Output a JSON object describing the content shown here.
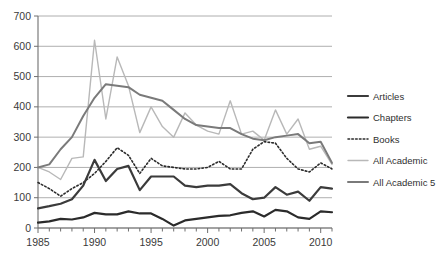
{
  "chart_data": {
    "type": "line",
    "title": "",
    "xlabel": "",
    "ylabel": "",
    "xlim": [
      1985,
      2011
    ],
    "ylim": [
      0,
      700
    ],
    "ytick_labels": [
      "0",
      "100",
      "200",
      "300",
      "400",
      "500",
      "600",
      "700"
    ],
    "yticks": [
      0,
      100,
      200,
      300,
      400,
      500,
      600,
      700
    ],
    "xtick_labels": [
      "1985",
      "1990",
      "1995",
      "2000",
      "2005",
      "2010"
    ],
    "xticks": [
      1985,
      1990,
      1995,
      2000,
      2005,
      2010
    ],
    "grid": "horizontal",
    "legend_position": "right",
    "x": [
      1985,
      1986,
      1987,
      1988,
      1989,
      1990,
      1991,
      1992,
      1993,
      1994,
      1995,
      1996,
      1997,
      1998,
      1999,
      2000,
      2001,
      2002,
      2003,
      2004,
      2005,
      2006,
      2007,
      2008,
      2009,
      2010,
      2011
    ],
    "series": [
      {
        "name": "Articles",
        "color": "#3b3b3b",
        "style": "solid",
        "width": 2.2,
        "values": [
          65,
          72,
          80,
          95,
          140,
          225,
          155,
          195,
          205,
          125,
          170,
          170,
          170,
          140,
          135,
          140,
          140,
          145,
          115,
          95,
          100,
          135,
          110,
          120,
          90,
          135,
          130
        ]
      },
      {
        "name": "Chapters",
        "color": "#2b2b2b",
        "style": "solid",
        "width": 2.2,
        "values": [
          18,
          22,
          30,
          28,
          35,
          50,
          45,
          45,
          55,
          48,
          48,
          30,
          8,
          25,
          30,
          35,
          40,
          42,
          50,
          55,
          38,
          60,
          55,
          35,
          30,
          55,
          52
        ]
      },
      {
        "name": "Books",
        "color": "#2b2b2b",
        "style": "dotted",
        "width": 1.6,
        "values": [
          150,
          130,
          105,
          130,
          150,
          180,
          220,
          265,
          240,
          180,
          230,
          205,
          200,
          195,
          195,
          200,
          220,
          195,
          195,
          260,
          285,
          280,
          230,
          195,
          185,
          215,
          195
        ]
      },
      {
        "name": "All Academic",
        "color": "#b8b8b8",
        "style": "solid",
        "width": 1.4,
        "values": [
          200,
          185,
          160,
          230,
          235,
          620,
          360,
          565,
          470,
          315,
          400,
          335,
          300,
          380,
          340,
          320,
          310,
          420,
          310,
          320,
          290,
          390,
          310,
          360,
          260,
          270,
          210
        ]
      },
      {
        "name": "All Academic 5",
        "color": "#7a7a7a",
        "style": "solid",
        "width": 2.0,
        "values": [
          200,
          210,
          260,
          300,
          370,
          430,
          475,
          470,
          465,
          440,
          430,
          420,
          390,
          360,
          340,
          335,
          330,
          330,
          310,
          295,
          290,
          300,
          305,
          310,
          280,
          285,
          215
        ]
      }
    ]
  },
  "axes": {
    "y_labels": [
      "700",
      "600",
      "500",
      "400",
      "300",
      "200",
      "100",
      "0"
    ],
    "x_labels": [
      "1985",
      "1990",
      "1995",
      "2000",
      "2005",
      "2010"
    ]
  },
  "legend": {
    "items": [
      {
        "label": "Articles"
      },
      {
        "label": "Chapters"
      },
      {
        "label": "Books"
      },
      {
        "label": "All Academic"
      },
      {
        "label": "All Academic 5"
      }
    ]
  },
  "colors": {
    "grid": "#9a9a9a",
    "axis": "#6f6f6f",
    "text": "#3a3a3a",
    "background": "#ffffff"
  }
}
